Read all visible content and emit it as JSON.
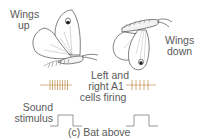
{
  "labels": {
    "wings_up": [
      "Wings",
      "up"
    ],
    "wings_down": [
      "Wings",
      "down"
    ],
    "a1_cells": [
      "Left and",
      "right A1",
      "cells firing"
    ],
    "sound_stimulus": [
      "Sound",
      "stimulus"
    ],
    "caption": "(c) Bat above"
  },
  "colors": {
    "spike": "#c8a06a",
    "stimulus": "#8a8a8a",
    "text": "#5a5a5a",
    "outline": "#4a4a4a"
  },
  "spike_trains": {
    "left_wings_up": {
      "count": 8,
      "description": "dense firing"
    },
    "right_wings_down": {
      "count": 5,
      "description": "sparser firing"
    }
  },
  "stimulus_pulses": 2
}
